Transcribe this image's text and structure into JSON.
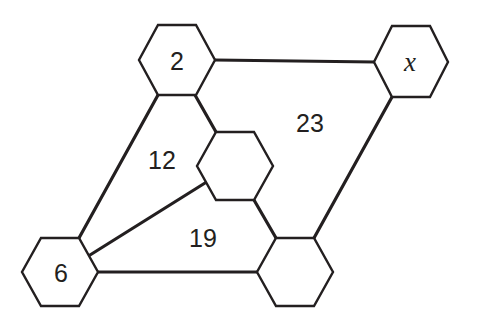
{
  "diagram": {
    "nodes": [
      {
        "id": "top-left",
        "label": "2"
      },
      {
        "id": "top-right",
        "label": "x"
      },
      {
        "id": "middle",
        "label": ""
      },
      {
        "id": "bottom-left",
        "label": "6"
      },
      {
        "id": "bottom-right",
        "label": ""
      }
    ],
    "regions": [
      {
        "id": "upper-right-region",
        "label": "23"
      },
      {
        "id": "left-region",
        "label": "12"
      },
      {
        "id": "lower-region",
        "label": "19"
      }
    ],
    "edges": [
      {
        "from": "top-left",
        "to": "top-right"
      },
      {
        "from": "top-left",
        "to": "bottom-left"
      },
      {
        "from": "top-left",
        "to": "middle"
      },
      {
        "from": "middle",
        "to": "bottom-left"
      },
      {
        "from": "middle",
        "to": "bottom-right"
      },
      {
        "from": "top-right",
        "to": "bottom-right"
      },
      {
        "from": "bottom-left",
        "to": "bottom-right"
      }
    ],
    "colors": {
      "stroke": "#231f20",
      "background": "#ffffff"
    }
  }
}
